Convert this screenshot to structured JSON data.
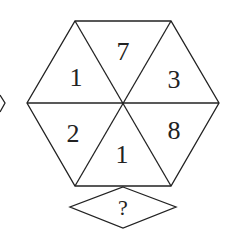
{
  "puzzle": {
    "hexagon_segments": [
      {
        "position": "top",
        "value": "7"
      },
      {
        "position": "upper-right",
        "value": "3"
      },
      {
        "position": "lower-right",
        "value": "8"
      },
      {
        "position": "bottom",
        "value": "1"
      },
      {
        "position": "lower-left",
        "value": "2"
      },
      {
        "position": "upper-left",
        "value": "1"
      }
    ],
    "answer_box": {
      "label": "?"
    }
  },
  "colors": {
    "stroke": "#222222",
    "background": "#ffffff"
  }
}
